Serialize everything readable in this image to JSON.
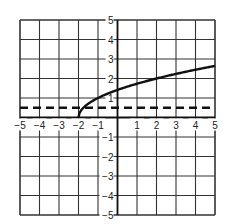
{
  "chart_data": {
    "type": "line",
    "title": "",
    "xlabel": "",
    "ylabel": "",
    "xlim": [
      -5,
      5
    ],
    "ylim": [
      -5,
      5
    ],
    "grid": true,
    "x_ticks": [
      -5,
      -4,
      -3,
      -2,
      -1,
      1,
      2,
      3,
      4,
      5
    ],
    "y_ticks": [
      -5,
      -4,
      -3,
      -2,
      -1,
      1,
      2,
      3,
      4,
      5
    ],
    "x_tick_labels": [
      "−5",
      "−4",
      "−3",
      "−2",
      "−1",
      "1",
      "2",
      "3",
      "4",
      "5"
    ],
    "y_tick_labels": [
      "−5",
      "−4",
      "−3",
      "−2",
      "−1",
      "1",
      "2",
      "3",
      "4",
      "5"
    ],
    "series": [
      {
        "name": "curve",
        "style": "solid",
        "function": "sqrt(x+2)",
        "x": [
          -2,
          -1.75,
          -1.5,
          -1,
          0,
          1,
          2,
          3,
          4,
          5
        ],
        "values": [
          0,
          0.5,
          0.71,
          1.0,
          1.41,
          1.73,
          2.0,
          2.24,
          2.45,
          2.65
        ]
      },
      {
        "name": "horizontal dashed line",
        "style": "dashed",
        "x": [
          -5,
          5
        ],
        "values": [
          0.5,
          0.5
        ]
      }
    ],
    "colors": {
      "grid": "#333333",
      "curve": "#111111",
      "dashed": "#111111",
      "background": "#ffffff"
    }
  }
}
